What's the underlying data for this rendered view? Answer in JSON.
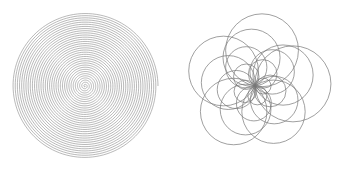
{
  "figures": [
    {
      "id": "archimedean-spiral",
      "type": "spiral",
      "center": [
        85,
        86
      ],
      "max_radius": 73,
      "turns": 34,
      "stroke": "#8a8a8a",
      "stroke_width": 0.6
    },
    {
      "id": "rotated-circle-rosette",
      "type": "rosette",
      "center": [
        88,
        86
      ],
      "circle_count": 20,
      "symmetry": 5,
      "min_radius": 8,
      "max_radius": 38,
      "stroke": "#777777",
      "stroke_width": 0.7
    }
  ]
}
